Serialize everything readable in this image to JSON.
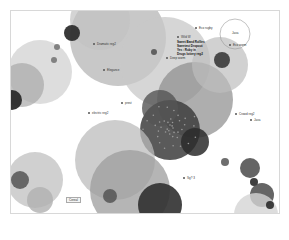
{
  "visualization": {
    "type": "bubble-network",
    "colors": {
      "background": "#ffffff",
      "frame": "#d8d8d8",
      "light": "#cfcfcf",
      "mid": "#a9a9a9",
      "dark": "#5a5a5a",
      "darkest": "#2a2a2a"
    },
    "bubbles": [
      {
        "cx": 118,
        "cy": 38,
        "r": 48,
        "fill": "#b5b5b5",
        "op": 0.75
      },
      {
        "cx": 100,
        "cy": 20,
        "r": 30,
        "fill": "#c2c2c2",
        "op": 0.7
      },
      {
        "cx": 72,
        "cy": 33,
        "r": 8,
        "fill": "#2f2f2f",
        "op": 0.95
      },
      {
        "cx": 40,
        "cy": 72,
        "r": 32,
        "fill": "#d4d4d4",
        "op": 0.8
      },
      {
        "cx": 22,
        "cy": 85,
        "r": 22,
        "fill": "#a8a8a8",
        "op": 0.7
      },
      {
        "cx": 12,
        "cy": 100,
        "r": 10,
        "fill": "#2a2a2a",
        "op": 0.95
      },
      {
        "cx": 57,
        "cy": 47,
        "r": 3,
        "fill": "#777777",
        "op": 0.9
      },
      {
        "cx": 54,
        "cy": 60,
        "r": 3,
        "fill": "#777777",
        "op": 0.9
      },
      {
        "cx": 165,
        "cy": 62,
        "r": 45,
        "fill": "#c8c8c8",
        "op": 0.75
      },
      {
        "cx": 195,
        "cy": 100,
        "r": 38,
        "fill": "#8c8c8c",
        "op": 0.7
      },
      {
        "cx": 220,
        "cy": 65,
        "r": 28,
        "fill": "#bdbdbd",
        "op": 0.7
      },
      {
        "cx": 222,
        "cy": 60,
        "r": 8,
        "fill": "#3a3a3a",
        "op": 0.9
      },
      {
        "cx": 154,
        "cy": 52,
        "r": 3,
        "fill": "#555555",
        "op": 0.9
      },
      {
        "cx": 235,
        "cy": 34,
        "r": 15,
        "fill": "none",
        "stroke": "#999999",
        "op": 1
      },
      {
        "cx": 170,
        "cy": 130,
        "r": 30,
        "fill": "#3d3d3d",
        "op": 0.85
      },
      {
        "cx": 160,
        "cy": 108,
        "r": 18,
        "fill": "#555555",
        "op": 0.8
      },
      {
        "cx": 195,
        "cy": 142,
        "r": 14,
        "fill": "#2b2b2b",
        "op": 0.85
      },
      {
        "cx": 115,
        "cy": 160,
        "r": 40,
        "fill": "#bcbcbc",
        "op": 0.75
      },
      {
        "cx": 130,
        "cy": 190,
        "r": 40,
        "fill": "#9c9c9c",
        "op": 0.75
      },
      {
        "cx": 160,
        "cy": 205,
        "r": 22,
        "fill": "#303030",
        "op": 0.9
      },
      {
        "cx": 110,
        "cy": 196,
        "r": 7,
        "fill": "#555555",
        "op": 0.85
      },
      {
        "cx": 35,
        "cy": 180,
        "r": 28,
        "fill": "#c4c4c4",
        "op": 0.8
      },
      {
        "cx": 20,
        "cy": 180,
        "r": 9,
        "fill": "#555555",
        "op": 0.85
      },
      {
        "cx": 40,
        "cy": 200,
        "r": 13,
        "fill": "#b0b0b0",
        "op": 0.8
      },
      {
        "cx": 225,
        "cy": 162,
        "r": 4,
        "fill": "#555555",
        "op": 0.85
      },
      {
        "cx": 250,
        "cy": 168,
        "r": 10,
        "fill": "#4a4a4a",
        "op": 0.85
      },
      {
        "cx": 254,
        "cy": 182,
        "r": 4,
        "fill": "#2a2a2a",
        "op": 0.9
      },
      {
        "cx": 262,
        "cy": 195,
        "r": 12,
        "fill": "#4a4a4a",
        "op": 0.85
      },
      {
        "cx": 256,
        "cy": 215,
        "r": 22,
        "fill": "#d5d5d5",
        "op": 0.8
      },
      {
        "cx": 270,
        "cy": 205,
        "r": 4,
        "fill": "#2a2a2a",
        "op": 0.9
      }
    ],
    "labels": [
      {
        "x": 93,
        "y": 42,
        "text": "Dramatic reg2"
      },
      {
        "x": 103,
        "y": 68,
        "text": "Elegance"
      },
      {
        "x": 195,
        "y": 26,
        "text": "Eco rugby"
      },
      {
        "x": 177,
        "y": 35,
        "text": "Wild W"
      },
      {
        "x": 88,
        "y": 111,
        "text": "electric reg2"
      },
      {
        "x": 121,
        "y": 101,
        "text": "prest"
      },
      {
        "x": 235,
        "y": 112,
        "text": "Crowd reg2"
      },
      {
        "x": 250,
        "y": 118,
        "text": "Java"
      },
      {
        "x": 183,
        "y": 176,
        "text": "Sg? 3"
      },
      {
        "x": 229,
        "y": 43,
        "text": "Eco worm"
      },
      {
        "x": 166,
        "y": 56,
        "text": "Deep worm"
      }
    ],
    "tooltip": {
      "x": 177,
      "y": 40,
      "lines": [
        "Sweet Band Rollies",
        "Sweetest Dropout",
        "Yes : Ruby in",
        "Drugs lottery reg2"
      ]
    },
    "circle_label": {
      "x": 232,
      "y": 31,
      "text": "Java"
    },
    "box_label": {
      "x": 66,
      "y": 197,
      "text": "Cereal"
    }
  }
}
